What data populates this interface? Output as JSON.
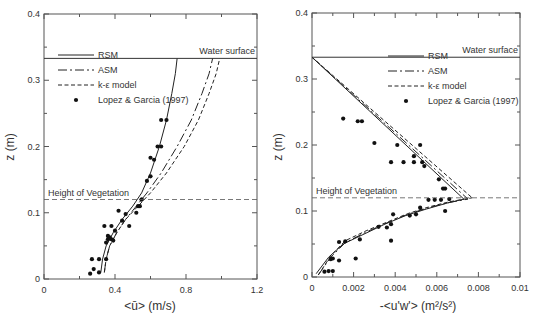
{
  "chart_data": [
    {
      "type": "line",
      "title": "",
      "xlabel": "<ū> (m/s)",
      "ylabel": "z (m)",
      "xlim": [
        0,
        1.2
      ],
      "ylim": [
        0,
        0.4
      ],
      "xticks": [
        0,
        0.4,
        0.8,
        1.2
      ],
      "xtick_labels": [
        "0",
        "0.4",
        "0.8",
        "1.2"
      ],
      "yticks": [
        0,
        0.1,
        0.2,
        0.3,
        0.4
      ],
      "ytick_labels": [
        "0",
        "0.1",
        "0.2",
        "0.3",
        "0.4"
      ],
      "grid": false,
      "legend_position": "upper left",
      "annotations": [
        {
          "text": "Water surface",
          "z": 0.333
        },
        {
          "text": "Height of Vegetation",
          "z": 0.12
        }
      ],
      "series": [
        {
          "name": "RSM",
          "style": "solid",
          "x": [
            0.32,
            0.33,
            0.35,
            0.39,
            0.44,
            0.5,
            0.55,
            0.6,
            0.65,
            0.69,
            0.72,
            0.74,
            0.75
          ],
          "y": [
            0.01,
            0.03,
            0.05,
            0.07,
            0.09,
            0.11,
            0.13,
            0.16,
            0.2,
            0.24,
            0.28,
            0.31,
            0.333
          ]
        },
        {
          "name": "ASM",
          "style": "dashdot",
          "x": [
            0.34,
            0.35,
            0.37,
            0.41,
            0.46,
            0.52,
            0.58,
            0.66,
            0.75,
            0.83,
            0.89,
            0.93,
            0.95
          ],
          "y": [
            0.01,
            0.03,
            0.05,
            0.07,
            0.09,
            0.11,
            0.13,
            0.16,
            0.2,
            0.24,
            0.28,
            0.31,
            0.333
          ]
        },
        {
          "name": "k-ε model",
          "style": "dashed",
          "x": [
            0.34,
            0.35,
            0.37,
            0.41,
            0.46,
            0.53,
            0.6,
            0.69,
            0.79,
            0.87,
            0.93,
            0.97,
            0.99
          ],
          "y": [
            0.01,
            0.03,
            0.05,
            0.07,
            0.09,
            0.11,
            0.13,
            0.16,
            0.2,
            0.24,
            0.28,
            0.31,
            0.333
          ]
        },
        {
          "name": "Lopez & Garcia (1997)",
          "style": "markers",
          "x": [
            0.26,
            0.28,
            0.27,
            0.31,
            0.31,
            0.35,
            0.35,
            0.38,
            0.36,
            0.37,
            0.36,
            0.39,
            0.4,
            0.38,
            0.34,
            0.42,
            0.44,
            0.46,
            0.48,
            0.52,
            0.53,
            0.54,
            0.55,
            0.55,
            0.58,
            0.6,
            0.62,
            0.6,
            0.64,
            0.66,
            0.69,
            0.66
          ],
          "y": [
            0.008,
            0.015,
            0.03,
            0.03,
            0.01,
            0.03,
            0.055,
            0.06,
            0.06,
            0.063,
            0.065,
            0.058,
            0.073,
            0.08,
            0.08,
            0.103,
            0.088,
            0.098,
            0.08,
            0.1,
            0.11,
            0.11,
            0.12,
            0.12,
            0.148,
            0.155,
            0.18,
            0.183,
            0.2,
            0.2,
            0.24,
            0.24
          ]
        }
      ]
    },
    {
      "type": "line",
      "title": "",
      "xlabel": "-<u'w'> (m²/s²)",
      "ylabel": "z (m)",
      "xlim": [
        0,
        0.01
      ],
      "ylim": [
        0,
        0.4
      ],
      "xticks": [
        0,
        0.002,
        0.004,
        0.006,
        0.008,
        0.01
      ],
      "xtick_labels": [
        "0",
        "0.002",
        "0.004",
        "0.006",
        "0.008",
        "0.01"
      ],
      "yticks": [
        0,
        0.1,
        0.2,
        0.3,
        0.4
      ],
      "ytick_labels": [
        "0",
        "0.1",
        "0.2",
        "0.3",
        "0.4"
      ],
      "grid": false,
      "legend_position": "upper right",
      "annotations": [
        {
          "text": "Water surface",
          "z": 0.333
        },
        {
          "text": "Height of Vegetation",
          "z": 0.12
        }
      ],
      "series": [
        {
          "name": "RSM",
          "style": "solid",
          "x": [
            0.0002,
            0.0008,
            0.0015,
            0.0025,
            0.0035,
            0.0045,
            0.0055,
            0.0065,
            0.0073,
            0.0,
            0.0073
          ],
          "y": [
            0.005,
            0.03,
            0.05,
            0.065,
            0.08,
            0.093,
            0.103,
            0.112,
            0.118,
            0.333,
            0.118
          ]
        },
        {
          "name": "ASM",
          "style": "dashdot",
          "x": [
            0.0003,
            0.0009,
            0.0016,
            0.0026,
            0.0036,
            0.0046,
            0.0056,
            0.0066,
            0.0075,
            0.0,
            0.0075
          ],
          "y": [
            0.003,
            0.03,
            0.052,
            0.068,
            0.082,
            0.095,
            0.105,
            0.113,
            0.118,
            0.333,
            0.118
          ]
        },
        {
          "name": "k-ε model",
          "style": "dashed",
          "x": [
            0.0003,
            0.0009,
            0.0016,
            0.0026,
            0.0036,
            0.0046,
            0.0056,
            0.0066,
            0.0077,
            0.0,
            0.0077
          ],
          "y": [
            0.003,
            0.032,
            0.055,
            0.07,
            0.083,
            0.096,
            0.106,
            0.114,
            0.12,
            0.333,
            0.12
          ]
        },
        {
          "name": "Lopez & Garcia (1997)",
          "style": "markers",
          "x": [
            0.0006,
            0.0008,
            0.001,
            0.0009,
            0.001,
            0.0013,
            0.0013,
            0.0016,
            0.0021,
            0.0023,
            0.0032,
            0.0036,
            0.0038,
            0.0038,
            0.0039,
            0.0047,
            0.005,
            0.0052,
            0.0056,
            0.0059,
            0.0062,
            0.0064,
            0.0066,
            0.0064,
            0.0063,
            0.0061,
            0.0038,
            0.0044,
            0.0049,
            0.0053,
            0.0054,
            0.0052,
            0.0049,
            0.0041,
            0.003,
            0.0024,
            0.0022,
            0.0015
          ],
          "y": [
            0.008,
            0.009,
            0.009,
            0.027,
            0.028,
            0.025,
            0.053,
            0.054,
            0.028,
            0.057,
            0.076,
            0.075,
            0.08,
            0.055,
            0.095,
            0.093,
            0.095,
            0.105,
            0.117,
            0.117,
            0.117,
            0.134,
            0.118,
            0.1,
            0.134,
            0.148,
            0.174,
            0.174,
            0.174,
            0.174,
            0.168,
            0.2,
            0.183,
            0.2,
            0.203,
            0.236,
            0.236,
            0.24
          ]
        }
      ]
    }
  ],
  "panels": [
    {
      "water_label": "Water surface",
      "veg_label": "Height of Vegetation",
      "xlabel_text": "<ū> (m/s)",
      "ylabel_text": "z (m)",
      "legend": [
        "RSM",
        "ASM",
        "k-ε model",
        "Lopez & Garcia (1997)"
      ]
    },
    {
      "water_label": "Water surface",
      "veg_label": "Height of Vegetation",
      "xlabel_text": "-<u'w'> (m²/s²)",
      "ylabel_text": "z (m)",
      "legend": [
        "RSM",
        "ASM",
        "k-ε model",
        "Lopez & Garcia (1997)"
      ]
    }
  ]
}
